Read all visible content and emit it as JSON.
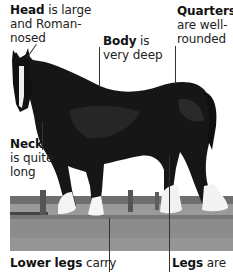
{
  "figure": {
    "colors": {
      "background": "#ffffff",
      "horse_coat": "#151515",
      "white_markings": "#f2f2f2",
      "grass": "#8f8f8f",
      "fence": "#5a5a5a",
      "leader_line": "#333333",
      "text": "#222222"
    }
  },
  "annotations": [
    {
      "id": "head",
      "term": "Head",
      "lines": [
        " is large",
        "and Roman-",
        "nosed"
      ]
    },
    {
      "id": "body",
      "term": "Body",
      "lines": [
        " is",
        "very deep"
      ]
    },
    {
      "id": "quarters",
      "term": "Quarters",
      "lines": [
        "",
        "are well-",
        "rounded"
      ]
    },
    {
      "id": "neck",
      "term": "Neck",
      "lines": [
        "",
        "is quite",
        "long"
      ]
    },
    {
      "id": "lower-legs",
      "term": "Lower legs",
      "lines": [
        " carry"
      ]
    },
    {
      "id": "legs",
      "term": "Legs",
      "lines": [
        " are"
      ]
    }
  ]
}
